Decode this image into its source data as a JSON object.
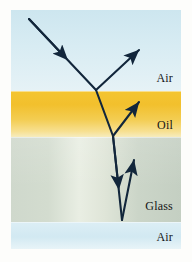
{
  "figure": {
    "frame_color": "#fdfdfb"
  },
  "layers": [
    {
      "id": "air-top",
      "label": "Air",
      "color_top": "#cde6ef",
      "color_bottom": "#e6f2f6",
      "y_start": 0,
      "y_end": 81
    },
    {
      "id": "oil",
      "label": "Oil",
      "color_top": "#f4c531",
      "color_bottom": "#f6ecbe",
      "y_start": 81,
      "y_end": 127
    },
    {
      "id": "glass",
      "label": "Glass",
      "color_top": "#cfd8cc",
      "color_bottom": "#c4cfc2",
      "y_start": 127,
      "y_end": 212
    },
    {
      "id": "air-bottom",
      "label": "Air",
      "color_top": "#dceef5",
      "color_bottom": "#e8f4f8",
      "y_start": 212,
      "y_end": 239
    }
  ],
  "rays": {
    "stroke_color": "#12263b",
    "items": [
      {
        "id": "incident-ray",
        "name": "incident-ray",
        "description": "Incoming ray descending from upper left to the air-oil interface",
        "points": "18,9 85,80",
        "arrow_mid": true
      },
      {
        "id": "reflected-ray-air",
        "name": "reflected-ray-air",
        "description": "Ray reflected off the air-oil interface back up to the right",
        "points": "85,80 128,40",
        "arrow_tip": true
      },
      {
        "id": "refracted-ray-oil",
        "name": "refracted-ray-oil",
        "description": "Ray refracted into the oil layer travelling down-right to the oil-glass interface",
        "points": "85,80 102,126"
      },
      {
        "id": "reflected-ray-oil",
        "name": "reflected-ray-oil",
        "description": "Ray reflected off the oil-glass interface up to the right through the oil",
        "points": "102,126 128,92",
        "arrow_tip": true
      },
      {
        "id": "refracted-ray-glass",
        "name": "refracted-ray-glass",
        "description": "Ray refracted into the glass travelling nearly straight down to the glass-air interface",
        "points": "102,126 111,210",
        "arrow_mid": true
      },
      {
        "id": "reflected-ray-glass",
        "name": "reflected-ray-glass",
        "description": "Ray reflected off the glass-air interface back up through the glass",
        "points": "111,210 123,150",
        "arrow_tip": true
      }
    ]
  }
}
